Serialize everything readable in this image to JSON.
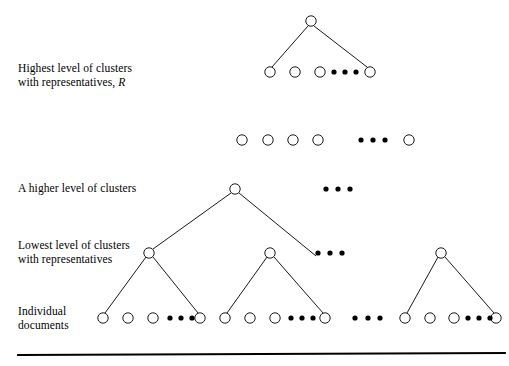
{
  "figure": {
    "background_color": "#ffffff",
    "stroke_color": "#000000",
    "node_fill_color": "#ffffff",
    "labels": [
      {
        "id": "highest-level",
        "line1": "Highest level of clusters",
        "line2_prefix": "with representatives,",
        "line2_italic": "R",
        "x": 18,
        "y": 62
      },
      {
        "id": "higher-level",
        "line1": "A higher level of clusters",
        "line2_prefix": "",
        "line2_italic": "",
        "x": 18,
        "y": 182
      },
      {
        "id": "lowest-level",
        "line1": "Lowest level of clusters",
        "line2_prefix": "with representatives",
        "line2_italic": "",
        "x": 18,
        "y": 239
      },
      {
        "id": "individual-documents",
        "line1": "Individual",
        "line2_prefix": "documents",
        "line2_italic": "",
        "x": 18,
        "y": 305
      }
    ],
    "node_radius": 5.2,
    "dot_radius": 2.6,
    "rows": [
      {
        "id": "root-row",
        "y": 21,
        "nodes": [
          {
            "id": "root-node",
            "x": 311
          }
        ],
        "dots": []
      },
      {
        "id": "highest-level-row",
        "y": 72,
        "nodes": [
          {
            "id": "r2-n1",
            "x": 270
          },
          {
            "id": "r2-n2",
            "x": 295
          },
          {
            "id": "r2-n3",
            "x": 320
          },
          {
            "id": "r2-n4",
            "x": 370
          }
        ],
        "dots": [
          {
            "x": 334
          },
          {
            "x": 345
          },
          {
            "x": 356
          }
        ]
      },
      {
        "id": "intermediate-row",
        "y": 140,
        "nodes": [
          {
            "id": "r3-n1",
            "x": 242
          },
          {
            "id": "r3-n2",
            "x": 268
          },
          {
            "id": "r3-n3",
            "x": 293
          },
          {
            "id": "r3-n4",
            "x": 318
          },
          {
            "id": "r3-n5",
            "x": 409
          }
        ],
        "dots": [
          {
            "x": 361
          },
          {
            "x": 373
          },
          {
            "x": 385
          }
        ]
      },
      {
        "id": "higher-level-row",
        "y": 189,
        "nodes": [
          {
            "id": "higher-cluster-node",
            "x": 235
          }
        ],
        "dots": [
          {
            "x": 326
          },
          {
            "x": 338
          },
          {
            "x": 350
          }
        ]
      },
      {
        "id": "lowest-level-row",
        "y": 253,
        "nodes": [
          {
            "id": "cluster-node-1",
            "x": 149
          },
          {
            "id": "cluster-node-2",
            "x": 270
          },
          {
            "id": "cluster-node-3",
            "x": 441
          }
        ],
        "dots": [
          {
            "x": 318
          },
          {
            "x": 330
          },
          {
            "x": 342
          }
        ]
      },
      {
        "id": "documents-row",
        "y": 318,
        "nodes": [
          {
            "id": "doc-1",
            "x": 103
          },
          {
            "id": "doc-2",
            "x": 128
          },
          {
            "id": "doc-3",
            "x": 153
          },
          {
            "id": "doc-4",
            "x": 200
          },
          {
            "id": "doc-5",
            "x": 225
          },
          {
            "id": "doc-6",
            "x": 250
          },
          {
            "id": "doc-7",
            "x": 275
          },
          {
            "id": "doc-8",
            "x": 325
          },
          {
            "id": "doc-9",
            "x": 405
          },
          {
            "id": "doc-10",
            "x": 430
          },
          {
            "id": "doc-11",
            "x": 454
          },
          {
            "id": "doc-12",
            "x": 496
          }
        ],
        "dots": [
          {
            "x": 170
          },
          {
            "x": 181
          },
          {
            "x": 192
          },
          {
            "x": 291
          },
          {
            "x": 302
          },
          {
            "x": 313
          },
          {
            "x": 355
          },
          {
            "x": 368
          },
          {
            "x": 380
          },
          {
            "x": 468
          },
          {
            "x": 479
          },
          {
            "x": 490
          }
        ]
      }
    ],
    "edges": [
      {
        "id": "edge-root-left",
        "x1": 308,
        "y1": 26,
        "x2": 272,
        "y2": 67
      },
      {
        "id": "edge-root-right",
        "x1": 314,
        "y1": 26,
        "x2": 367,
        "y2": 67
      },
      {
        "id": "edge-higher-left",
        "x1": 231,
        "y1": 193,
        "x2": 153,
        "y2": 249
      },
      {
        "id": "edge-higher-right",
        "x1": 239,
        "y1": 193,
        "x2": 316,
        "y2": 256
      },
      {
        "id": "edge-c1-d1",
        "x1": 146,
        "y1": 257,
        "x2": 105,
        "y2": 313
      },
      {
        "id": "edge-c1-d4",
        "x1": 153,
        "y1": 257,
        "x2": 198,
        "y2": 313
      },
      {
        "id": "edge-c2-d5",
        "x1": 267,
        "y1": 257,
        "x2": 227,
        "y2": 313
      },
      {
        "id": "edge-c2-d8",
        "x1": 274,
        "y1": 257,
        "x2": 323,
        "y2": 313
      },
      {
        "id": "edge-c3-d9",
        "x1": 438,
        "y1": 257,
        "x2": 407,
        "y2": 313
      },
      {
        "id": "edge-c3-d12",
        "x1": 445,
        "y1": 257,
        "x2": 494,
        "y2": 313
      }
    ],
    "baseline_rule": {
      "id": "baseline-rule",
      "x1": 18,
      "y1": 355,
      "x2": 505,
      "y2": 353,
      "stroke_width": 1.8
    }
  }
}
